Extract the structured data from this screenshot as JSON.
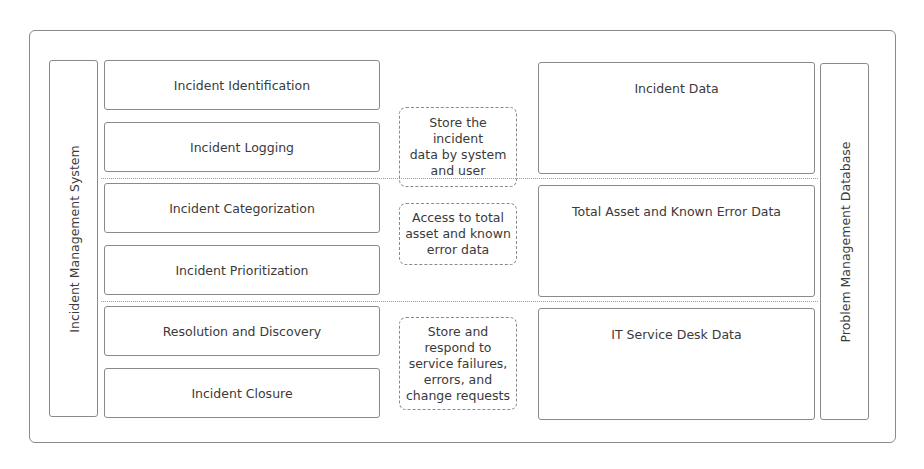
{
  "diagram": {
    "left_system": {
      "label": "Incident Management System"
    },
    "right_system": {
      "label": "Problem Management Database"
    },
    "rows": [
      {
        "steps": [
          "Incident Identification",
          "Incident Logging"
        ],
        "note": "Store the\nincident\ndata by system\nand user",
        "data": "Incident Data"
      },
      {
        "steps": [
          "Incident Categorization",
          "Incident Prioritization"
        ],
        "note": "Access to total\nasset and known\nerror data",
        "data": "Total Asset and Known Error Data"
      },
      {
        "steps": [
          "Resolution and Discovery",
          "Incident Closure"
        ],
        "note": "Store and\nrespond to\nservice failures,\nerrors, and\nchange requests",
        "data": "IT Service Desk Data"
      }
    ]
  },
  "colors": {
    "border": "#8a8a8a",
    "divider": "#9a9a9a",
    "text": "#3a3a3a",
    "background": "#ffffff"
  }
}
